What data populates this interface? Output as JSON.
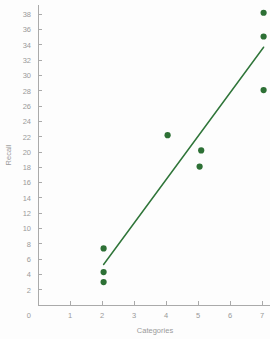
{
  "chart_data": {
    "type": "scatter",
    "title": "",
    "xlabel": "Categories",
    "ylabel": "Recall",
    "xlim": [
      0,
      7.6
    ],
    "ylim": [
      0,
      39.2
    ],
    "grid": false,
    "legend": null,
    "xticks": [
      0,
      1,
      2,
      3,
      4,
      5,
      6,
      7
    ],
    "xtick_labels": [
      "0",
      "1",
      "2",
      "3",
      "4",
      "5",
      "6",
      "7"
    ],
    "yticks": [
      2,
      4,
      6,
      8,
      10,
      12,
      14,
      16,
      18,
      20,
      22,
      24,
      26,
      28,
      30,
      32,
      34,
      36,
      38
    ],
    "ytick_labels": [
      "2",
      "4",
      "6",
      "8",
      "10",
      "12",
      "14",
      "16",
      "18",
      "20",
      "22",
      "24",
      "26",
      "28",
      "30",
      "32",
      "34",
      "36",
      "38"
    ],
    "y_origin_label": "0",
    "marker_color": "#2d7035",
    "line_color": "#2f7539",
    "axis_color": "#aaaaaa",
    "tick_label_color": "#9a9a9a",
    "background_color": "#fdfdfd",
    "marker_size": 4.2,
    "line_width": 1.5,
    "series": [
      {
        "name": "observations",
        "points": [
          {
            "x": 2.05,
            "y": 7.4
          },
          {
            "x": 2.05,
            "y": 4.3
          },
          {
            "x": 2.05,
            "y": 3.0
          },
          {
            "x": 4.05,
            "y": 22.2
          },
          {
            "x": 5.1,
            "y": 20.2
          },
          {
            "x": 5.05,
            "y": 18.1
          },
          {
            "x": 7.05,
            "y": 38.2
          },
          {
            "x": 7.05,
            "y": 35.1
          },
          {
            "x": 7.05,
            "y": 28.1
          }
        ]
      }
    ],
    "trend_line": {
      "name": "fit-line",
      "x_start": 2.05,
      "y_start": 5.3,
      "x_end": 7.05,
      "y_end": 33.7
    }
  }
}
